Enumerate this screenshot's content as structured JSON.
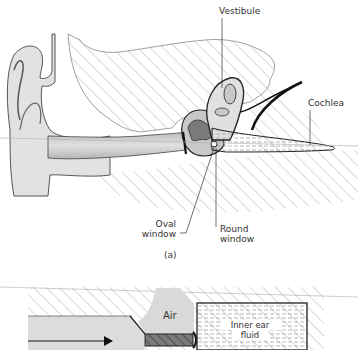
{
  "figure": {
    "panel_a": {
      "caption": "(a)",
      "labels": {
        "vestibule": "Vestibule",
        "cochlea": "Cochlea",
        "oval_window_line1": "Oval",
        "oval_window_line2": "window",
        "round_window_line1": "Round",
        "round_window_line2": "window"
      }
    },
    "panel_b": {
      "labels": {
        "air": "Air",
        "inner_ear_fluid_line1": "Inner ear",
        "inner_ear_fluid_line2": "fluid"
      }
    }
  },
  "colors": {
    "line": "#333333",
    "hatch": "#9a9a9a",
    "canal_fill": "#d0d0d0",
    "dark_fill": "#7a7a7a",
    "light_fill": "#e4e4e4"
  }
}
